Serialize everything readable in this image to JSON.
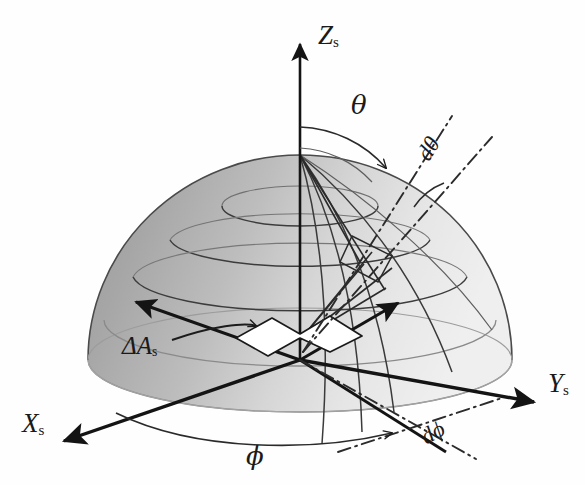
{
  "figure": {
    "kind": "spherical-coordinate-hemisphere-diagram",
    "background_color": "#fefefe",
    "ink_color": "#1a1a1a",
    "width": 585,
    "height": 485
  },
  "axes": [
    {
      "id": "z",
      "name": "z-axis",
      "label": "Z",
      "subscript": "s",
      "label_x": 318,
      "label_y": 22,
      "from": [
        300,
        360
      ],
      "to": [
        300,
        36
      ],
      "arrow": "up"
    },
    {
      "id": "y",
      "name": "y-axis",
      "label": "Y",
      "subscript": "s",
      "label_x": 548,
      "label_y": 370,
      "from": [
        300,
        360
      ],
      "to": [
        543,
        404
      ],
      "arrow": "right-down"
    },
    {
      "id": "x",
      "name": "x-axis",
      "label": "X",
      "subscript": "s",
      "label_x": 22,
      "label_y": 410,
      "from": [
        300,
        360
      ],
      "to": [
        55,
        444
      ],
      "arrow": "left-down"
    }
  ],
  "angles": [
    {
      "id": "theta",
      "name": "polar-angle",
      "label": "θ",
      "label_x": 351,
      "label_y": 92,
      "description": "polar angle measured from the Z axis"
    },
    {
      "id": "phi",
      "name": "azimuth-angle",
      "label": "ϕ",
      "label_x": 246,
      "label_y": 443,
      "description": "azimuth angle measured from the X axis in the XY plane"
    }
  ],
  "differentials": [
    {
      "id": "dtheta",
      "name": "d-theta",
      "label": "dθ",
      "label_x": 417,
      "label_y": 137,
      "rotation_deg": -58
    },
    {
      "id": "dphi",
      "name": "d-phi",
      "label": "dϕ",
      "label_x": 421,
      "label_y": 421,
      "rotation_deg": -29
    }
  ],
  "area_element": {
    "id": "delta_a_s",
    "name": "surface-area-element",
    "label": "ΔA",
    "subscript": "s",
    "label_x": 122,
    "label_y": 333,
    "patch_color": "#ffffff",
    "description": "small white quadrilateral patch at the origin on the XY plane"
  },
  "hemisphere": {
    "name": "hemisphere-dome",
    "center": [
      300,
      360
    ],
    "radius_x": 212,
    "radius_y": 205,
    "base_ellipse_ry": 52,
    "fill_left": "#a6a6a6",
    "fill_right": "#ececec",
    "outline_color": "#3a3a3a",
    "latitude_circles": 4,
    "meridian_lines": 5
  }
}
